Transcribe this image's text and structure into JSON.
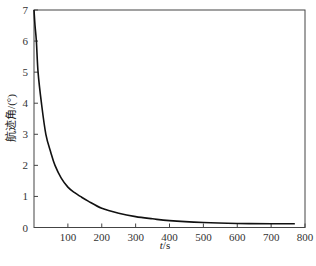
{
  "chart_data": {
    "type": "line",
    "title": "",
    "xlabel": "t/s",
    "xlabel_var": "t",
    "xlabel_unit": "/s",
    "ylabel": "航迹角/(°)",
    "xlim": [
      0,
      800
    ],
    "ylim": [
      0,
      7
    ],
    "xticks": [
      100,
      200,
      300,
      400,
      500,
      600,
      700,
      800
    ],
    "yticks": [
      0,
      1,
      2,
      3,
      4,
      5,
      6,
      7
    ],
    "grid": false,
    "legend": null,
    "series": [
      {
        "name": "航迹角",
        "color": "#111111",
        "x": [
          0,
          3,
          7,
          12,
          22,
          35,
          50,
          62,
          80,
          100,
          120,
          137,
          160,
          200,
          250,
          300,
          350,
          400,
          500,
          600,
          700,
          770
        ],
        "y": [
          7.0,
          6.5,
          6.0,
          5.0,
          4.0,
          3.0,
          2.4,
          2.0,
          1.6,
          1.3,
          1.12,
          1.0,
          0.85,
          0.62,
          0.46,
          0.35,
          0.28,
          0.22,
          0.16,
          0.13,
          0.12,
          0.12
        ]
      }
    ]
  }
}
